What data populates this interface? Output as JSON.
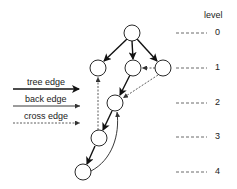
{
  "diagram": {
    "level_header": "level",
    "levels": [
      "0",
      "1",
      "2",
      "3",
      "4"
    ],
    "legend": {
      "tree_edge": "tree edge",
      "back_edge": "back edge",
      "cross_edge": "cross edge"
    },
    "nodes": [
      {
        "id": "a",
        "level": 0
      },
      {
        "id": "b",
        "level": 1
      },
      {
        "id": "c",
        "level": 1
      },
      {
        "id": "d",
        "level": 1
      },
      {
        "id": "e",
        "level": 2
      },
      {
        "id": "f",
        "level": 3
      },
      {
        "id": "g",
        "level": 4
      }
    ],
    "edges": [
      {
        "from": "a",
        "to": "b",
        "type": "tree"
      },
      {
        "from": "a",
        "to": "c",
        "type": "tree"
      },
      {
        "from": "a",
        "to": "d",
        "type": "tree"
      },
      {
        "from": "c",
        "to": "e",
        "type": "tree"
      },
      {
        "from": "e",
        "to": "f",
        "type": "tree"
      },
      {
        "from": "f",
        "to": "g",
        "type": "tree"
      },
      {
        "from": "g",
        "to": "e",
        "type": "back"
      },
      {
        "from": "d",
        "to": "c",
        "type": "cross"
      },
      {
        "from": "d",
        "to": "e",
        "type": "cross"
      },
      {
        "from": "f",
        "to": "b",
        "type": "cross"
      }
    ],
    "colors": {
      "stroke": "#111111",
      "text": "#222222",
      "background": "#ffffff"
    }
  }
}
